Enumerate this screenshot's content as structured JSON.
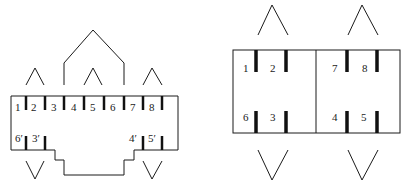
{
  "figure": {
    "stroke_color": "#1a1a1a",
    "background": "#ffffff"
  },
  "left_diagram": {
    "top_labels": [
      "1",
      "2",
      "3",
      "4",
      "5",
      "6",
      "7",
      "8"
    ],
    "bottom_labels": [
      "6′",
      "3′",
      "4′",
      "5′"
    ]
  },
  "right_diagram": {
    "left_block": {
      "top_labels": [
        "1",
        "2"
      ],
      "bottom_labels": [
        "6",
        "3"
      ]
    },
    "right_block": {
      "top_labels": [
        "7",
        "8"
      ],
      "bottom_labels": [
        "4",
        "5"
      ]
    }
  }
}
